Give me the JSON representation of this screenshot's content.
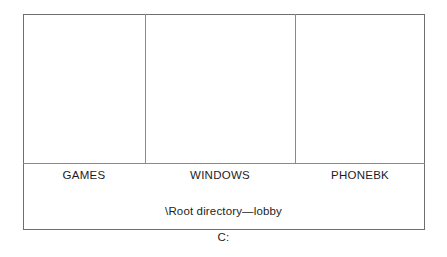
{
  "diagram": {
    "drive_letter": "C:",
    "root_caption": "\\Root directory—lobby",
    "folders": [
      {
        "name": "GAMES"
      },
      {
        "name": "WINDOWS"
      },
      {
        "name": "PHONEBK"
      }
    ],
    "colors": {
      "background": "#ffffff",
      "outer_border": "#6e6e6e",
      "divider": "#8a8a8a",
      "rule": "#8a8a8a",
      "text": "#1d1d1d"
    }
  }
}
